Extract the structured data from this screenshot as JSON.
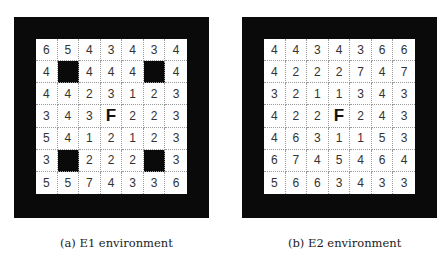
{
  "figures": [
    {
      "id": "a",
      "caption": "(a) E1 environment",
      "grid": [
        [
          "6",
          "5",
          "4",
          "3",
          "4",
          "3",
          "4"
        ],
        [
          "4",
          "#",
          "4",
          "4",
          "4",
          "#",
          "4"
        ],
        [
          "4",
          "4",
          "2",
          "3",
          "1",
          "2",
          "3"
        ],
        [
          "3",
          "4",
          "3",
          "F",
          "2",
          "2",
          "3"
        ],
        [
          "5",
          "4",
          "1",
          "2",
          "1",
          "2",
          "3"
        ],
        [
          "3",
          "#",
          "2",
          "2",
          "2",
          "#",
          "3"
        ],
        [
          "5",
          "5",
          "7",
          "4",
          "3",
          "3",
          "6"
        ]
      ]
    },
    {
      "id": "b",
      "caption": "(b) E2 environment",
      "grid": [
        [
          "4",
          "4",
          "3",
          "4",
          "3",
          "6",
          "6"
        ],
        [
          "4",
          "2",
          "2",
          "2",
          "7",
          "4",
          "7"
        ],
        [
          "3",
          "2",
          "1",
          "1",
          "3",
          "4",
          "3"
        ],
        [
          "4",
          "2",
          "2",
          "F",
          "2",
          "4",
          "3"
        ],
        [
          "4",
          "6",
          "3",
          "1",
          "1",
          "5",
          "3"
        ],
        [
          "6",
          "7",
          "4",
          "5",
          "4",
          "6",
          "4"
        ],
        [
          "5",
          "6",
          "6",
          "3",
          "4",
          "3",
          "3"
        ]
      ]
    }
  ],
  "legend": {
    "obstacle_symbol": "#",
    "goal_symbol": "F"
  },
  "colors": {
    "wall": "#0a0a0a",
    "cell_bg": "#ffffff",
    "grid_line": "#9a9a9a"
  }
}
